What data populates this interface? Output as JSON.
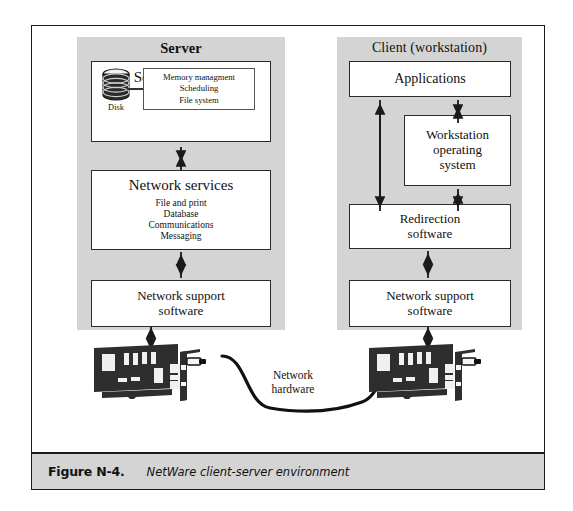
{
  "figure": {
    "number_label": "Figure N-4.",
    "caption": "NetWare client-server environment"
  },
  "server_column": {
    "title": "Server",
    "platform": {
      "title": "Server platform",
      "functions": [
        "Memory managment",
        "Scheduling",
        "File system"
      ],
      "disk_label": "Disk",
      "disk_icon": "disk-cylinder-icon"
    },
    "network_services": {
      "title": "Network services",
      "items": [
        "File and print",
        "Database",
        "Communications",
        "Messaging"
      ]
    },
    "network_support": {
      "line1": "Network support",
      "line2": "software"
    }
  },
  "client_column": {
    "title": "Client (workstation)",
    "applications": {
      "title": "Applications"
    },
    "operating_system": {
      "line1": "Workstation",
      "line2": "operating",
      "line3": "system"
    },
    "redirection": {
      "line1": "Redirection",
      "line2": "software"
    },
    "network_support": {
      "line1": "Network support",
      "line2": "software"
    }
  },
  "network_hardware": {
    "line1": "Network",
    "line2": "hardware",
    "server_nic_icon": "network-interface-card-icon",
    "client_nic_icon": "network-interface-card-icon",
    "cable_icon": "network-cable-icon"
  },
  "colors": {
    "panel_gray": "#d4d4d4",
    "box_white": "#ffffff",
    "outline_dark": "#2b2b2b",
    "nic_body": "#2e2e2e"
  }
}
